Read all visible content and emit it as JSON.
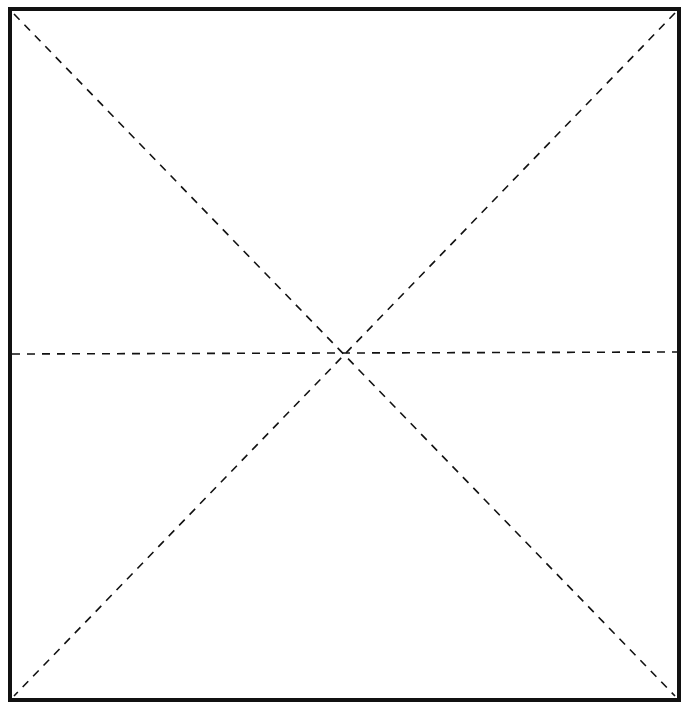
{
  "diagram": {
    "type": "folding-pattern",
    "colors": {
      "background": "#ffffff",
      "stroke": "#111111"
    },
    "outline": {
      "x1": 10,
      "y1": 9,
      "x2": 679,
      "y2": 700,
      "stroke_width": 4
    },
    "fold_lines": [
      {
        "name": "diagonal-top-left-to-bottom-right",
        "x1": 14,
        "y1": 14,
        "x2": 675,
        "y2": 696,
        "style": "dashed"
      },
      {
        "name": "diagonal-top-right-to-bottom-left",
        "x1": 675,
        "y1": 13,
        "x2": 14,
        "y2": 696,
        "style": "dashed"
      },
      {
        "name": "horizontal-midline",
        "x1": 12,
        "y1": 354,
        "x2": 677,
        "y2": 352,
        "style": "dashed"
      }
    ]
  }
}
